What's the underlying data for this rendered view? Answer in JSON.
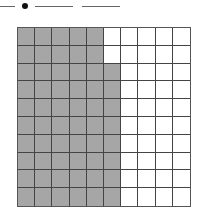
{
  "header": {
    "blanks": [
      {
        "left": 0,
        "width": 15
      },
      {
        "left": 35,
        "width": 38
      },
      {
        "left": 82,
        "width": 38
      }
    ],
    "separator": "decimal-dot"
  },
  "grid": {
    "rows": 10,
    "cols": 10,
    "shaded_per_row": [
      5,
      5,
      6,
      6,
      6,
      6,
      6,
      6,
      6,
      6
    ],
    "shaded_total": 58,
    "shade_color": "#a6a6a6",
    "line_color": "#444444"
  }
}
